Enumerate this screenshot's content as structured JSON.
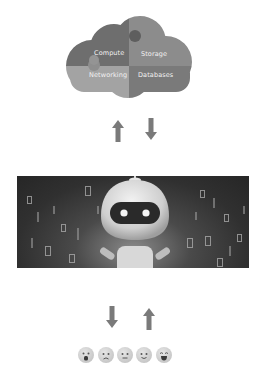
{
  "diagram": {
    "cloud": {
      "quadrants": [
        {
          "label": "Compute",
          "color": "#6e6e6e"
        },
        {
          "label": "Storage",
          "color": "#8c8c8c"
        },
        {
          "label": "Networking",
          "color": "#a3a3a3"
        },
        {
          "label": "Databases",
          "color": "#7a7a7a"
        }
      ]
    },
    "arrows_top": [
      {
        "direction": "up",
        "icon": "arrow-up-icon"
      },
      {
        "direction": "down",
        "icon": "arrow-down-icon"
      }
    ],
    "robot_banner": {
      "subject": "robot with binary code background",
      "icon": "robot-icon"
    },
    "arrows_bottom": [
      {
        "direction": "down",
        "icon": "arrow-down-icon"
      },
      {
        "direction": "up",
        "icon": "arrow-up-icon"
      }
    ],
    "emotions": [
      {
        "name": "shocked",
        "icon": "shocked-face-icon"
      },
      {
        "name": "sad",
        "icon": "sad-face-icon"
      },
      {
        "name": "neutral",
        "icon": "neutral-face-icon"
      },
      {
        "name": "slight-smile",
        "icon": "slight-smile-face-icon"
      },
      {
        "name": "laughing",
        "icon": "laughing-face-icon"
      }
    ],
    "arrow_color": "#7a7a7a"
  }
}
